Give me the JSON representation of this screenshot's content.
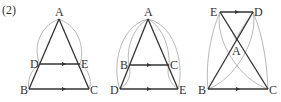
{
  "problem_label": "(2)",
  "colors": {
    "edge": "#333333",
    "arc": "#9a9a9a",
    "label": "#333333",
    "background": "#ffffff"
  },
  "figures": [
    {
      "labels": {
        "A": "A",
        "B": "B",
        "C": "C",
        "D": "D",
        "E": "E"
      },
      "description": "Triangle ABC with DE parallel to BC, D on AB, E on AC"
    },
    {
      "labels": {
        "A": "A",
        "B": "B",
        "C": "C",
        "D": "D",
        "E": "E"
      },
      "description": "Triangle ADE with BC parallel to DE, B on AD, C on AE"
    },
    {
      "labels": {
        "A": "A",
        "B": "B",
        "C": "C",
        "D": "D",
        "E": "E"
      },
      "description": "Lines BD and CE cross at A, ED parallel to BC"
    }
  ]
}
